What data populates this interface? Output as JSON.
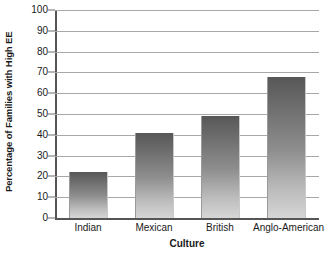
{
  "chart_data": {
    "type": "bar",
    "title": "",
    "subtitle": "",
    "categories": [
      "Indian",
      "Mexican",
      "British",
      "Anglo-American"
    ],
    "values": [
      22,
      41,
      49,
      68
    ],
    "xlabel": "Culture",
    "ylabel": "Percentage of Families with High EE",
    "ylim": [
      0,
      100
    ],
    "ytick_labels": [
      "0",
      "10",
      "20",
      "30",
      "40",
      "50",
      "60",
      "70",
      "80",
      "90",
      "100"
    ],
    "ytick_values": [
      0,
      10,
      20,
      30,
      40,
      50,
      60,
      70,
      80,
      90,
      100
    ],
    "grid": "horizontal",
    "legend": "none",
    "annotations": [],
    "series": [
      {
        "name": "Percentage of Families with High EE",
        "values": [
          22,
          41,
          49,
          68
        ]
      }
    ],
    "colors": {
      "bar_top": "#575757",
      "bar_bottom": "#d6d6d6",
      "gridline": "#a8a8a8",
      "axis": "#555555",
      "text": "#1a1a1a",
      "background": "#ffffff"
    }
  }
}
